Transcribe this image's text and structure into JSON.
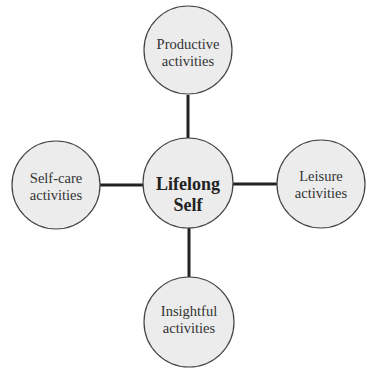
{
  "diagram": {
    "center": {
      "lines": [
        "Lifelong",
        "Self"
      ]
    },
    "nodes": {
      "top": {
        "lines": [
          "Productive",
          "activities"
        ]
      },
      "left": {
        "lines": [
          "Self-care",
          "activities"
        ]
      },
      "right": {
        "lines": [
          "Leisure",
          "activities"
        ]
      },
      "bottom": {
        "lines": [
          "Insightful",
          "activities"
        ]
      }
    },
    "colors": {
      "fill": "#ececec",
      "stroke": "#444444",
      "connector": "#222222"
    }
  }
}
